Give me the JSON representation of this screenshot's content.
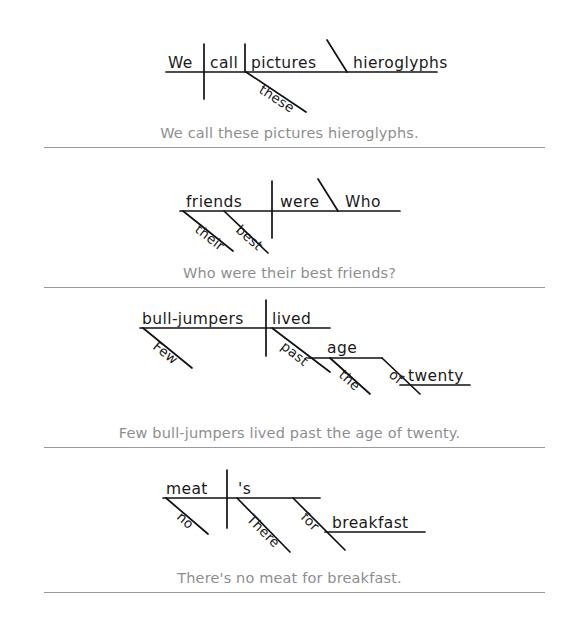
{
  "page": {
    "type": "sentence-diagramming-worksheet",
    "background_color": "#ffffff",
    "ink_color": "#111111",
    "caption_color": "#8e8e90",
    "divider_color": "#9a9a9e",
    "width": 579,
    "height": 632
  },
  "sections": [
    {
      "id": "diagram-1",
      "caption": "We call these pictures hieroglyphs.",
      "words": {
        "subject": "We",
        "verb": "call",
        "object": "pictures",
        "object_complement": "hieroglyphs",
        "modifier": "these"
      },
      "labels": [
        "We",
        "call",
        "pictures",
        "hieroglyphs",
        "these"
      ]
    },
    {
      "id": "diagram-2",
      "caption": "Who were their best friends?",
      "words": {
        "subject": "friends",
        "verb": "were",
        "predicate_nominative": "Who",
        "modifier_1": "their",
        "modifier_2": "best"
      },
      "labels": [
        "friends",
        "were",
        "Who",
        "their",
        "best"
      ]
    },
    {
      "id": "diagram-3",
      "caption": "Few bull-jumpers lived past the age of twenty.",
      "words": {
        "subject": "bull-jumpers",
        "verb": "lived",
        "modifier": "Few",
        "preposition_1": "past",
        "object_1": "age",
        "article": "the",
        "preposition_2": "of",
        "object_2": "twenty"
      },
      "labels": [
        "bull-jumpers",
        "lived",
        "Few",
        "past",
        "age",
        "the",
        "of",
        "twenty"
      ]
    },
    {
      "id": "diagram-4",
      "caption": "There's no meat for breakfast.",
      "words": {
        "subject": "meat",
        "verb": "'s",
        "modifier": "no",
        "expletive": "There",
        "preposition": "for",
        "object": "breakfast"
      },
      "labels": [
        "meat",
        "'s",
        "no",
        "There",
        "for",
        "breakfast"
      ]
    }
  ]
}
